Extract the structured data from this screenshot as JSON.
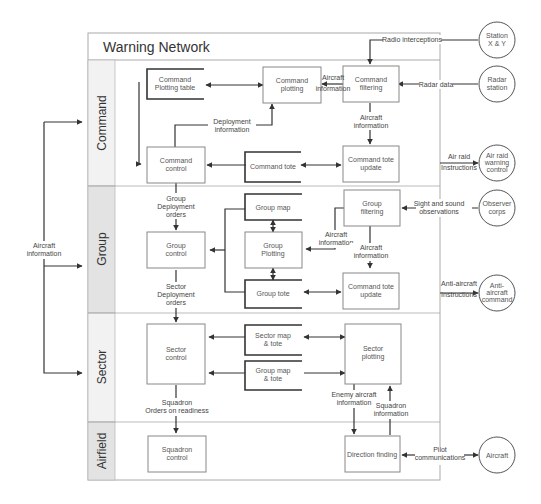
{
  "title": "Warning Network",
  "lanes": [
    {
      "id": "command",
      "label": "Command"
    },
    {
      "id": "group",
      "label": "Group"
    },
    {
      "id": "sector",
      "label": "Sector"
    },
    {
      "id": "airfield",
      "label": "Airfield"
    }
  ],
  "boxes": {
    "command_plotting_table": [
      "Command",
      "Plotting table"
    ],
    "command_plotting": [
      "Command",
      "plotting"
    ],
    "command_filtering": [
      "Command",
      "filtering"
    ],
    "command_control": [
      "Command",
      "control"
    ],
    "command_tote": [
      "Command tote"
    ],
    "command_tote_update": [
      "Command tote",
      "update"
    ],
    "group_map": [
      "Group map"
    ],
    "group_filtering": [
      "Group",
      "filtering"
    ],
    "group_control": [
      "Group",
      "control"
    ],
    "group_plotting": [
      "Group",
      "Plotting"
    ],
    "group_tote": [
      "Group tote"
    ],
    "group_command_tote_update": [
      "Command tote",
      "update"
    ],
    "sector_control": [
      "Sector",
      "control"
    ],
    "sector_map_tote": [
      "Sector map",
      "& tote"
    ],
    "group_map_tote": [
      "Group map",
      "& tote"
    ],
    "sector_plotting": [
      "Sector",
      "plotting"
    ],
    "squadron_control": [
      "Squadron",
      "control"
    ],
    "direction_finding": [
      "Direction finding"
    ]
  },
  "externals": {
    "station_xy": [
      "Station",
      "X & Y"
    ],
    "radar_station": [
      "Radar",
      "station"
    ],
    "air_raid_warning_control": [
      "Air raid",
      "warning",
      "control"
    ],
    "observer_corps": [
      "Observer",
      "corps"
    ],
    "anti_aircraft_command": [
      "Anti-",
      "aircraft",
      "command"
    ],
    "aircraft": [
      "Aircraft"
    ]
  },
  "labels": {
    "radio_interceptions": [
      "Radio interceptions"
    ],
    "radar_data": [
      "Radar data"
    ],
    "aircraft_info_cmd_plot": [
      "Aircraft",
      "information"
    ],
    "aircraft_info_cmd_update": [
      "Aircraft",
      "information"
    ],
    "deployment_information": [
      "Deployment",
      "information"
    ],
    "air_raid_instructions": [
      "Air raid",
      "Instructions"
    ],
    "group_deployment_orders": [
      "Group",
      "Deployment",
      "orders"
    ],
    "sight_sound": [
      "Sight and sound",
      "observations"
    ],
    "aircraft_info_group_plot": [
      "Aircraft",
      "information"
    ],
    "aircraft_info_group_update": [
      "Aircraft",
      "information"
    ],
    "sector_deployment_orders": [
      "Sector",
      "Deployment",
      "orders"
    ],
    "anti_aircraft_instructions": [
      "Anti-aircraft",
      "Instructions"
    ],
    "squadron_orders": [
      "Squadron",
      "Orders on readiness"
    ],
    "enemy_aircraft_info": [
      "Enemy aircraft",
      "information"
    ],
    "squadron_information": [
      "Squadron",
      "information"
    ],
    "pilot_communications": [
      "Pilot",
      "communications"
    ],
    "aircraft_information_left": [
      "Aircraft",
      "information"
    ]
  },
  "colors": {
    "line": "#333333",
    "frame": "#aaaaaa",
    "lane_fill_light": "#f2f2f2",
    "lane_fill_dark": "#e3e3e3",
    "box_border": "#888888"
  }
}
